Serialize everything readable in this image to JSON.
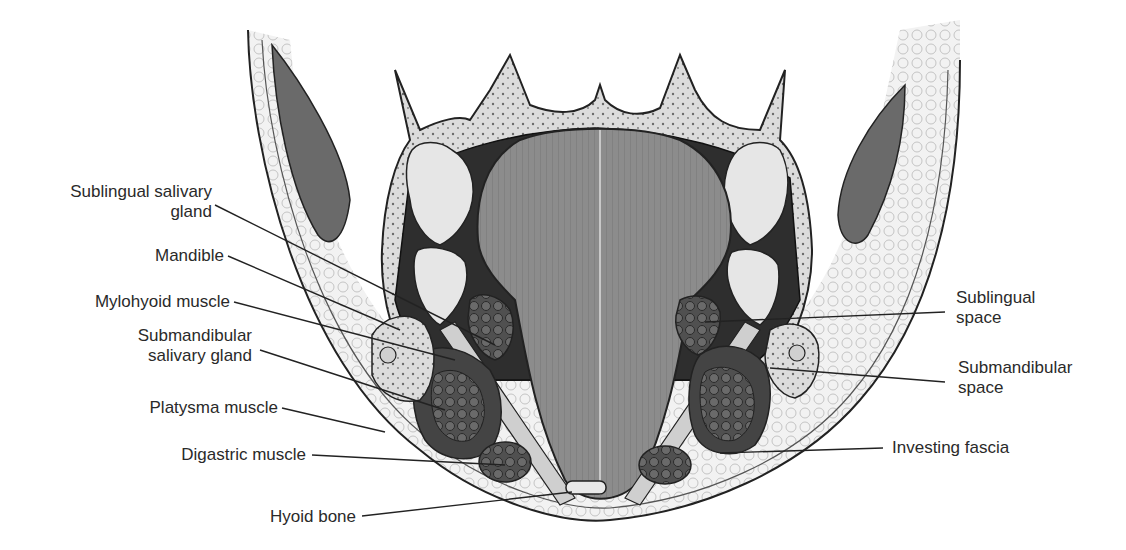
{
  "figure": {
    "labels_left": [
      {
        "id": "sublingual-salivary-gland",
        "lines": [
          "Sublingual salivary",
          "gland"
        ]
      },
      {
        "id": "mandible",
        "lines": [
          "Mandible"
        ]
      },
      {
        "id": "mylohyoid-muscle",
        "lines": [
          "Mylohyoid muscle"
        ]
      },
      {
        "id": "submandibular-salivary-gland",
        "lines": [
          "Submandibular",
          "salivary gland"
        ]
      },
      {
        "id": "platysma-muscle",
        "lines": [
          "Platysma muscle"
        ]
      },
      {
        "id": "digastric-muscle",
        "lines": [
          "Digastric muscle"
        ]
      },
      {
        "id": "hyoid-bone",
        "lines": [
          "Hyoid bone"
        ]
      }
    ],
    "labels_right": [
      {
        "id": "sublingual-space",
        "lines": [
          "Sublingual",
          "space"
        ]
      },
      {
        "id": "submandibular-space",
        "lines": [
          "Submandibular",
          "space"
        ]
      },
      {
        "id": "investing-fascia",
        "lines": [
          "Investing fascia"
        ]
      }
    ],
    "colors": {
      "line": "#222222",
      "dark_tissue": "#3a3a3a",
      "tongue": "#8a8a8a",
      "bone": "#d8d8d8",
      "fat": "#eeeeee",
      "muscle": "#6a6a6a",
      "gland": "#4a4a4a"
    }
  }
}
